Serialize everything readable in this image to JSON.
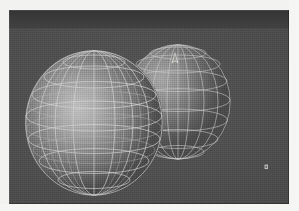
{
  "window": {
    "title": "",
    "toolbar_label": "",
    "frame_color": "#4a4a4a",
    "toolbar_color": "#393939"
  },
  "scene": {
    "name": "3d-wireframe-viewport",
    "background_color": "#4d4d4d",
    "shading_mode": "dithered-grayscale",
    "render_style": "wireframe-over-shaded",
    "objects": [
      {
        "name": "sphere-primary",
        "label": "Sphere A",
        "role": "foreground",
        "center_x": 101,
        "center_y": 113,
        "radius_x": 69,
        "radius_y": 73,
        "segments": 12,
        "rings": 8,
        "highlight_color": "#c3c3c3",
        "shadow_color": "#4b4b4b",
        "wire_color": "#d9d9d9"
      },
      {
        "name": "sphere-secondary",
        "label": "Sphere B",
        "role": "background",
        "center_x": 178,
        "center_y": 92,
        "radius_x": 53,
        "radius_y": 58,
        "segments": 10,
        "rings": 7,
        "highlight_color": "#a9a9a9",
        "shadow_color": "#4a4a4a",
        "wire_color": "#cfcfcf"
      }
    ],
    "intersection": {
      "name": "boolean-seam",
      "label": "Intersection crease",
      "color": "#17171a",
      "x": 133,
      "y": 94
    },
    "markers": [
      {
        "name": "cursor-marker",
        "label": "Pointer",
        "x": 166,
        "y": 46,
        "color": "#e8e8e4"
      },
      {
        "name": "stray-marker",
        "label": "Vertex handle",
        "x": 266,
        "y": 158,
        "color": "#dcdcd8"
      }
    ]
  }
}
